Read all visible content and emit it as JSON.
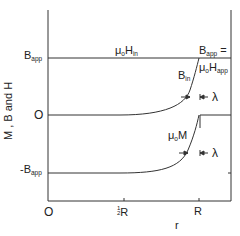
{
  "diagram": {
    "y_axis_label": "M , B and H",
    "x_axis_label": "r",
    "y_ticks": {
      "top": {
        "main": "B",
        "sub": "app"
      },
      "middle": "O",
      "bottom": {
        "prefix": "-B",
        "sub": "app"
      }
    },
    "x_ticks": {
      "origin": "O",
      "half": {
        "num": "1",
        "den": "2",
        "main": "R"
      },
      "full": "R"
    },
    "annotations": {
      "h_in": {
        "mu": "μ",
        "o": "o",
        "H": "H",
        "sub": "in"
      },
      "b_app_eq": {
        "main": "B",
        "sub": "app",
        "suffix": " ="
      },
      "mu_h_app": {
        "mu": "μ",
        "o": "o",
        "H": "H",
        "sub": "app"
      },
      "b_in": {
        "main": "B",
        "sub": "in"
      },
      "mu_m": {
        "mu": "μ",
        "o": "o",
        "M": "M"
      },
      "lambda_top": "λ",
      "lambda_bottom": "λ"
    },
    "colors": {
      "line": "#333333",
      "background": "#ffffff"
    }
  }
}
